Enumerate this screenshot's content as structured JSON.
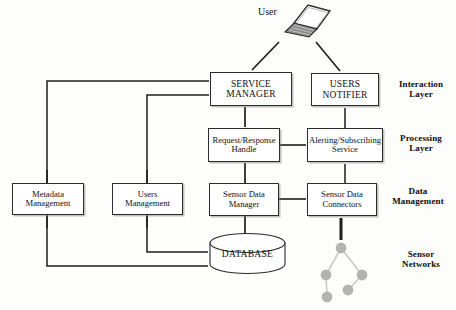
{
  "diagram": {
    "actor": {
      "label": "User",
      "icon": "laptop-icon"
    },
    "layers": [
      {
        "id": "interaction",
        "label_line1": "Interaction",
        "label_line2": "Layer"
      },
      {
        "id": "processing",
        "label_line1": "Processing",
        "label_line2": "Layer"
      },
      {
        "id": "data-management",
        "label_line1": "Data",
        "label_line2": "Management"
      },
      {
        "id": "sensor-networks",
        "label_line1": "Sensor",
        "label_line2": "Networks"
      }
    ],
    "nodes": [
      {
        "id": "service-manager",
        "line1": "SERVICE",
        "line2": "MANAGER",
        "style": "caps"
      },
      {
        "id": "users-notifier",
        "line1": "USERS",
        "line2": "NOTIFIER",
        "style": "caps"
      },
      {
        "id": "request-response-handle",
        "line1": "Request/Response",
        "line2": "Handle",
        "style": "mixed"
      },
      {
        "id": "alerting-subscribing-service",
        "line1": "Alerting/Subscribing",
        "line2": "Service",
        "style": "mixed"
      },
      {
        "id": "metadata-management",
        "line1": "Metadata",
        "line2": "Management",
        "style": "mixed"
      },
      {
        "id": "users-management",
        "line1": "Users",
        "line2": "Management",
        "style": "mixed"
      },
      {
        "id": "sensor-data-manager",
        "line1": "Sensor Data",
        "line2": "Manager",
        "style": "mixed"
      },
      {
        "id": "sensor-data-connectors",
        "line1": "Sensor Data",
        "line2": "Connectors",
        "style": "mixed"
      }
    ],
    "database": {
      "label": "DATABASE"
    },
    "sensor_network": {
      "node_count": 5,
      "node_color": "#b3b3b3",
      "link_color": "#c9c9c9"
    },
    "colors": {
      "stroke": "#2b2b2b",
      "text": "#111111",
      "background": "#fdfdfc",
      "shadow": "#787878"
    }
  }
}
